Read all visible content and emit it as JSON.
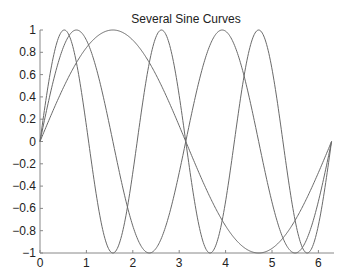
{
  "chart_data": {
    "type": "line",
    "title": "Several Sine Curves",
    "xlabel": "",
    "ylabel": "",
    "xlim": [
      0,
      6.2832
    ],
    "ylim": [
      -1,
      1
    ],
    "grid": false,
    "legend": null,
    "x_ticks": [
      "0",
      "1",
      "2",
      "3",
      "4",
      "5",
      "6"
    ],
    "y_ticks": [
      "1",
      "0.8",
      "0.6",
      "0.4",
      "0.2",
      "0",
      "-0.2",
      "-0.4",
      "-0.6",
      "-0.8",
      "-1"
    ],
    "series": [
      {
        "name": "sin(x)",
        "function": "sin(x)",
        "x_range": [
          0,
          6.2832
        ],
        "peaks": [
          {
            "x": 1.571,
            "y": 1
          }
        ],
        "troughs": [
          {
            "x": 4.712,
            "y": -1
          }
        ]
      },
      {
        "name": "sin(2x)",
        "function": "sin(2x)",
        "x_range": [
          0,
          6.2832
        ],
        "peaks": [
          {
            "x": 0.785,
            "y": 1
          },
          {
            "x": 3.927,
            "y": 1
          }
        ],
        "troughs": [
          {
            "x": 2.356,
            "y": -1
          },
          {
            "x": 5.498,
            "y": -1
          }
        ]
      },
      {
        "name": "sin(3x)",
        "function": "sin(3x)",
        "x_range": [
          0,
          6.2832
        ],
        "peaks": [
          {
            "x": 0.524,
            "y": 1
          },
          {
            "x": 2.618,
            "y": 1
          },
          {
            "x": 4.712,
            "y": 1
          }
        ],
        "troughs": [
          {
            "x": 1.571,
            "y": -1
          },
          {
            "x": 3.665,
            "y": -1
          },
          {
            "x": 5.76,
            "y": -1
          }
        ]
      }
    ],
    "line_color": "#6a6a6a"
  }
}
